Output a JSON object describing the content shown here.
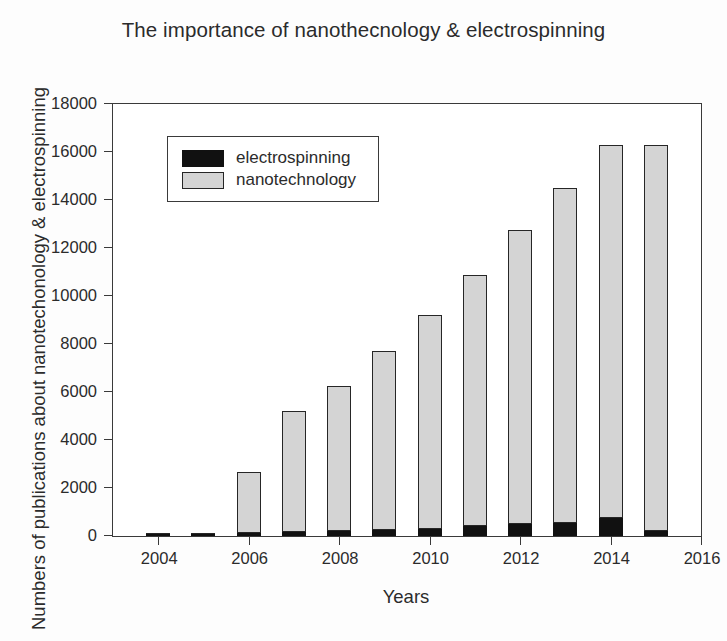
{
  "chart_data": {
    "type": "bar",
    "title": "The importance of nanothecnology & electrospinning",
    "xlabel": "Years",
    "ylabel": "Numbers of publications about nanotechonology & electrospinning",
    "stacked": true,
    "grid": false,
    "legend_position": "top-left inside plot",
    "xlim": [
      2003,
      2016
    ],
    "ylim": [
      0,
      18000
    ],
    "ytick_labels": [
      "0",
      "2000",
      "4000",
      "6000",
      "8000",
      "10000",
      "12000",
      "14000",
      "16000",
      "18000"
    ],
    "ytick_values": [
      0,
      2000,
      4000,
      6000,
      8000,
      10000,
      12000,
      14000,
      16000,
      18000
    ],
    "xtick_labels": [
      "2004",
      "2006",
      "2008",
      "2010",
      "2012",
      "2014",
      "2016"
    ],
    "xtick_values": [
      2004,
      2006,
      2008,
      2010,
      2012,
      2014,
      2016
    ],
    "categories": [
      2004,
      2005,
      2006,
      2007,
      2008,
      2009,
      2010,
      2011,
      2012,
      2013,
      2014,
      2015
    ],
    "series": [
      {
        "name": "electrospinning",
        "color": "#111111",
        "values": [
          30,
          60,
          110,
          160,
          190,
          260,
          300,
          400,
          500,
          560,
          750,
          200
        ]
      },
      {
        "name": "nanotechnology",
        "color": "#d4d4d4",
        "values": [
          20,
          40,
          2570,
          5060,
          6060,
          7450,
          8930,
          10490,
          12270,
          13950,
          15550,
          16100
        ]
      }
    ],
    "totals": [
      50,
      100,
      2680,
      5220,
      6250,
      7710,
      9230,
      10890,
      12770,
      14510,
      16300,
      16300
    ]
  },
  "legend": {
    "items": [
      {
        "label": "electrospinning",
        "swatch": "black-square-icon"
      },
      {
        "label": "nanotechnology",
        "swatch": "gray-square-icon"
      }
    ]
  }
}
